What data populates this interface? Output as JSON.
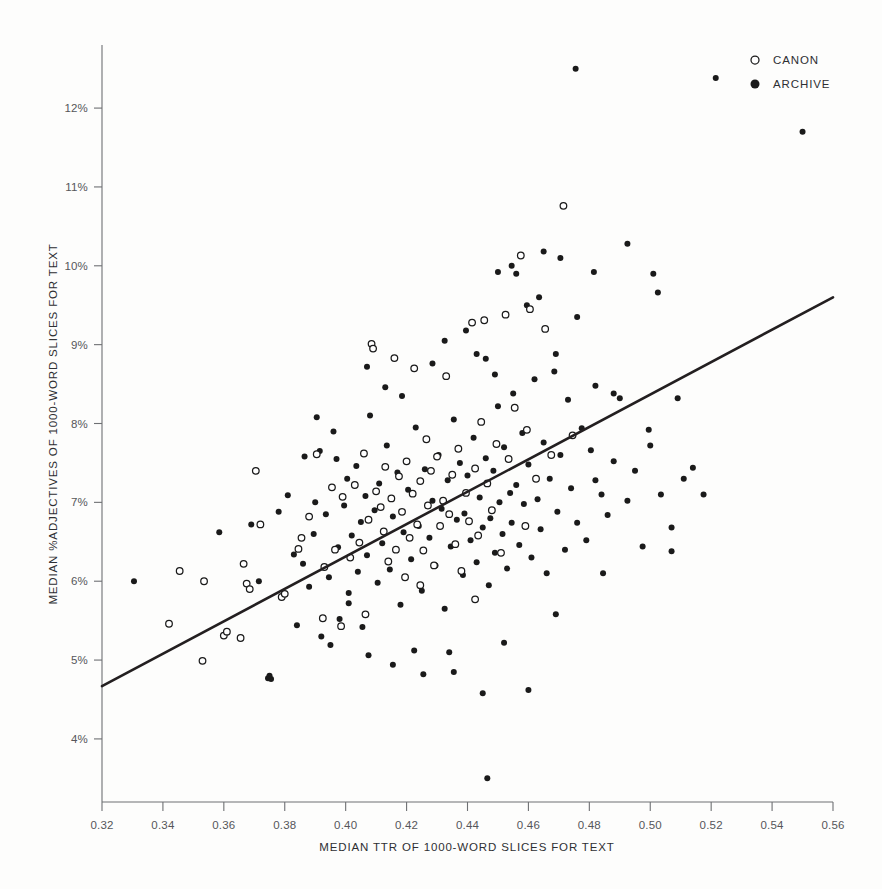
{
  "chart_data": {
    "type": "scatter",
    "title": "",
    "xlabel": "MEDIAN TTR OF 1000-WORD SLICES FOR TEXT",
    "ylabel": "MEDIAN %ADJECTIVES OF 1000-WORD SLICES FOR TEXT",
    "xlim": [
      0.32,
      0.56
    ],
    "ylim": [
      3.2,
      12.8
    ],
    "grid": false,
    "legend_position": "top-right",
    "xticks": [
      0.32,
      0.34,
      0.36,
      0.38,
      0.4,
      0.42,
      0.44,
      0.46,
      0.48,
      0.5,
      0.52,
      0.54,
      0.56
    ],
    "xtick_labels": [
      "0.32",
      "0.34",
      "0.36",
      "0.38",
      "0.40",
      "0.42",
      "0.44",
      "0.46",
      "0.48",
      "0.50",
      "0.52",
      "0.54",
      "0.56"
    ],
    "yticks": [
      4,
      5,
      6,
      7,
      8,
      9,
      10,
      11,
      12
    ],
    "ytick_labels": [
      "4%",
      "5%",
      "6%",
      "7%",
      "8%",
      "9%",
      "10%",
      "11%",
      "12%"
    ],
    "legend": [
      {
        "name": "CANON",
        "marker": "open-circle",
        "color": "#ffffff",
        "edge": "#1a1a1a"
      },
      {
        "name": "ARCHIVE",
        "marker": "filled-circle",
        "color": "#1a1a1a",
        "edge": "#1a1a1a"
      }
    ],
    "trendline": {
      "label": "linear fit",
      "x": [
        0.32,
        0.56
      ],
      "y": [
        4.67,
        9.6
      ],
      "color": "#231f20"
    },
    "series": [
      {
        "name": "CANON",
        "marker": "open-circle",
        "points": [
          [
            0.3455,
            6.13
          ],
          [
            0.342,
            5.46
          ],
          [
            0.353,
            4.99
          ],
          [
            0.3535,
            6.0
          ],
          [
            0.36,
            5.31
          ],
          [
            0.361,
            5.36
          ],
          [
            0.3655,
            5.28
          ],
          [
            0.3665,
            6.22
          ],
          [
            0.3675,
            5.97
          ],
          [
            0.3685,
            5.9
          ],
          [
            0.3705,
            7.4
          ],
          [
            0.372,
            6.72
          ],
          [
            0.379,
            5.8
          ],
          [
            0.38,
            5.84
          ],
          [
            0.3845,
            6.41
          ],
          [
            0.3855,
            6.55
          ],
          [
            0.388,
            6.82
          ],
          [
            0.3905,
            7.61
          ],
          [
            0.3925,
            5.53
          ],
          [
            0.393,
            6.18
          ],
          [
            0.3955,
            7.19
          ],
          [
            0.3965,
            6.4
          ],
          [
            0.3985,
            5.43
          ],
          [
            0.399,
            7.07
          ],
          [
            0.4015,
            6.3
          ],
          [
            0.403,
            7.22
          ],
          [
            0.4045,
            6.49
          ],
          [
            0.406,
            7.62
          ],
          [
            0.4075,
            6.78
          ],
          [
            0.4085,
            9.01
          ],
          [
            0.409,
            8.95
          ],
          [
            0.41,
            7.14
          ],
          [
            0.4115,
            6.94
          ],
          [
            0.4125,
            6.63
          ],
          [
            0.413,
            7.45
          ],
          [
            0.414,
            6.25
          ],
          [
            0.415,
            7.05
          ],
          [
            0.416,
            8.83
          ],
          [
            0.4165,
            6.4
          ],
          [
            0.4175,
            7.33
          ],
          [
            0.4185,
            6.88
          ],
          [
            0.4195,
            6.05
          ],
          [
            0.42,
            7.52
          ],
          [
            0.421,
            6.55
          ],
          [
            0.422,
            7.11
          ],
          [
            0.4225,
            8.7
          ],
          [
            0.4235,
            6.72
          ],
          [
            0.4245,
            7.27
          ],
          [
            0.4255,
            6.39
          ],
          [
            0.4265,
            7.8
          ],
          [
            0.427,
            6.96
          ],
          [
            0.428,
            7.4
          ],
          [
            0.429,
            6.2
          ],
          [
            0.43,
            7.58
          ],
          [
            0.431,
            6.7
          ],
          [
            0.432,
            7.02
          ],
          [
            0.433,
            8.6
          ],
          [
            0.434,
            6.85
          ],
          [
            0.435,
            7.35
          ],
          [
            0.436,
            6.47
          ],
          [
            0.437,
            7.68
          ],
          [
            0.438,
            6.13
          ],
          [
            0.4395,
            7.12
          ],
          [
            0.4405,
            6.76
          ],
          [
            0.4415,
            9.28
          ],
          [
            0.4425,
            7.43
          ],
          [
            0.4435,
            6.58
          ],
          [
            0.4445,
            8.02
          ],
          [
            0.4455,
            9.31
          ],
          [
            0.4465,
            7.24
          ],
          [
            0.448,
            6.9
          ],
          [
            0.4495,
            7.74
          ],
          [
            0.451,
            6.36
          ],
          [
            0.4525,
            9.38
          ],
          [
            0.4535,
            7.55
          ],
          [
            0.4555,
            8.2
          ],
          [
            0.4575,
            10.13
          ],
          [
            0.4595,
            7.92
          ],
          [
            0.4605,
            9.45
          ],
          [
            0.4625,
            7.3
          ],
          [
            0.4655,
            9.2
          ],
          [
            0.4675,
            7.6
          ],
          [
            0.4715,
            10.76
          ],
          [
            0.4745,
            7.85
          ],
          [
            0.459,
            6.7
          ],
          [
            0.4425,
            5.77
          ],
          [
            0.4065,
            5.58
          ],
          [
            0.4245,
            5.95
          ]
        ]
      },
      {
        "name": "ARCHIVE",
        "marker": "filled-circle",
        "points": [
          [
            0.3305,
            6.0
          ],
          [
            0.3585,
            6.62
          ],
          [
            0.3715,
            6.0
          ],
          [
            0.3745,
            4.77
          ],
          [
            0.3755,
            4.76
          ],
          [
            0.375,
            4.8
          ],
          [
            0.381,
            7.09
          ],
          [
            0.383,
            6.34
          ],
          [
            0.386,
            6.22
          ],
          [
            0.3865,
            7.58
          ],
          [
            0.388,
            5.93
          ],
          [
            0.3895,
            6.6
          ],
          [
            0.39,
            7.0
          ],
          [
            0.3915,
            7.65
          ],
          [
            0.392,
            5.3
          ],
          [
            0.3935,
            6.85
          ],
          [
            0.3945,
            6.05
          ],
          [
            0.395,
            5.19
          ],
          [
            0.396,
            7.9
          ],
          [
            0.3975,
            6.43
          ],
          [
            0.398,
            5.52
          ],
          [
            0.3995,
            6.96
          ],
          [
            0.4005,
            7.3
          ],
          [
            0.401,
            5.85
          ],
          [
            0.402,
            6.58
          ],
          [
            0.4035,
            7.46
          ],
          [
            0.404,
            6.12
          ],
          [
            0.405,
            6.75
          ],
          [
            0.4055,
            5.42
          ],
          [
            0.4065,
            7.08
          ],
          [
            0.407,
            6.33
          ],
          [
            0.408,
            8.1
          ],
          [
            0.4095,
            6.9
          ],
          [
            0.4105,
            5.98
          ],
          [
            0.411,
            7.24
          ],
          [
            0.412,
            6.48
          ],
          [
            0.4135,
            7.72
          ],
          [
            0.4145,
            6.15
          ],
          [
            0.4155,
            6.82
          ],
          [
            0.417,
            7.38
          ],
          [
            0.418,
            5.7
          ],
          [
            0.419,
            6.62
          ],
          [
            0.4205,
            7.16
          ],
          [
            0.4215,
            6.28
          ],
          [
            0.423,
            7.95
          ],
          [
            0.424,
            6.7
          ],
          [
            0.425,
            5.88
          ],
          [
            0.426,
            7.42
          ],
          [
            0.4275,
            6.55
          ],
          [
            0.4285,
            7.02
          ],
          [
            0.4295,
            6.2
          ],
          [
            0.4305,
            7.6
          ],
          [
            0.4315,
            6.92
          ],
          [
            0.4325,
            5.65
          ],
          [
            0.4335,
            7.28
          ],
          [
            0.4345,
            6.44
          ],
          [
            0.4355,
            8.05
          ],
          [
            0.4365,
            6.78
          ],
          [
            0.4375,
            7.5
          ],
          [
            0.4385,
            6.08
          ],
          [
            0.439,
            6.86
          ],
          [
            0.44,
            7.34
          ],
          [
            0.441,
            6.52
          ],
          [
            0.442,
            7.82
          ],
          [
            0.443,
            6.24
          ],
          [
            0.444,
            7.06
          ],
          [
            0.445,
            6.68
          ],
          [
            0.446,
            7.56
          ],
          [
            0.447,
            5.95
          ],
          [
            0.4475,
            6.8
          ],
          [
            0.4485,
            7.4
          ],
          [
            0.449,
            6.36
          ],
          [
            0.45,
            8.22
          ],
          [
            0.4505,
            7.0
          ],
          [
            0.4515,
            6.6
          ],
          [
            0.452,
            7.7
          ],
          [
            0.453,
            6.16
          ],
          [
            0.454,
            7.12
          ],
          [
            0.4545,
            6.74
          ],
          [
            0.455,
            8.38
          ],
          [
            0.456,
            7.22
          ],
          [
            0.457,
            6.46
          ],
          [
            0.458,
            7.88
          ],
          [
            0.4585,
            6.98
          ],
          [
            0.46,
            7.48
          ],
          [
            0.461,
            6.3
          ],
          [
            0.462,
            8.56
          ],
          [
            0.463,
            7.04
          ],
          [
            0.464,
            6.66
          ],
          [
            0.465,
            7.76
          ],
          [
            0.466,
            6.1
          ],
          [
            0.467,
            7.3
          ],
          [
            0.4685,
            8.66
          ],
          [
            0.4695,
            6.88
          ],
          [
            0.4705,
            7.6
          ],
          [
            0.472,
            6.4
          ],
          [
            0.473,
            8.3
          ],
          [
            0.474,
            7.18
          ],
          [
            0.476,
            6.74
          ],
          [
            0.4775,
            7.94
          ],
          [
            0.479,
            6.52
          ],
          [
            0.4805,
            7.66
          ],
          [
            0.482,
            8.48
          ],
          [
            0.484,
            7.1
          ],
          [
            0.486,
            6.84
          ],
          [
            0.488,
            7.52
          ],
          [
            0.49,
            8.32
          ],
          [
            0.4925,
            7.02
          ],
          [
            0.495,
            7.4
          ],
          [
            0.4975,
            6.44
          ],
          [
            0.5,
            7.72
          ],
          [
            0.5035,
            7.1
          ],
          [
            0.507,
            6.68
          ],
          [
            0.511,
            7.3
          ],
          [
            0.4635,
            9.6
          ],
          [
            0.4705,
            10.1
          ],
          [
            0.476,
            9.35
          ],
          [
            0.4815,
            9.92
          ],
          [
            0.465,
            10.18
          ],
          [
            0.4545,
            10.0
          ],
          [
            0.45,
            9.92
          ],
          [
            0.443,
            8.88
          ],
          [
            0.456,
            9.9
          ],
          [
            0.4595,
            9.5
          ],
          [
            0.4925,
            10.28
          ],
          [
            0.5025,
            9.66
          ],
          [
            0.501,
            9.9
          ],
          [
            0.4755,
            12.5
          ],
          [
            0.5215,
            12.38
          ],
          [
            0.55,
            11.7
          ],
          [
            0.4465,
            3.5
          ],
          [
            0.445,
            4.58
          ],
          [
            0.46,
            4.62
          ],
          [
            0.4255,
            4.82
          ],
          [
            0.4155,
            4.94
          ],
          [
            0.4075,
            5.06
          ],
          [
            0.434,
            5.1
          ],
          [
            0.452,
            5.22
          ],
          [
            0.469,
            5.58
          ],
          [
            0.4845,
            6.1
          ],
          [
            0.507,
            6.38
          ],
          [
            0.514,
            7.44
          ],
          [
            0.4995,
            7.92
          ],
          [
            0.509,
            8.32
          ],
          [
            0.4355,
            4.85
          ],
          [
            0.4225,
            5.12
          ],
          [
            0.401,
            5.72
          ],
          [
            0.384,
            5.44
          ],
          [
            0.378,
            6.88
          ],
          [
            0.369,
            6.72
          ],
          [
            0.397,
            7.55
          ],
          [
            0.3905,
            8.08
          ],
          [
            0.413,
            8.46
          ],
          [
            0.407,
            8.72
          ],
          [
            0.4285,
            8.76
          ],
          [
            0.4185,
            8.35
          ],
          [
            0.446,
            8.82
          ],
          [
            0.4325,
            9.05
          ],
          [
            0.4395,
            9.18
          ],
          [
            0.449,
            8.62
          ],
          [
            0.469,
            8.88
          ],
          [
            0.488,
            8.38
          ],
          [
            0.482,
            7.28
          ],
          [
            0.5175,
            7.1
          ]
        ]
      }
    ]
  },
  "axes": {
    "y_title": "MEDIAN %ADJECTIVES OF 1000-WORD SLICES FOR TEXT",
    "x_title": "MEDIAN TTR OF 1000-WORD SLICES FOR TEXT"
  },
  "colors": {
    "archive": "#1a1a1a",
    "canon_fill": "#ffffff",
    "canon_edge": "#1a1a1a",
    "axis": "#6e7073",
    "trend": "#231f20",
    "background": "#fdfdfc",
    "text": "#2e2f33"
  }
}
